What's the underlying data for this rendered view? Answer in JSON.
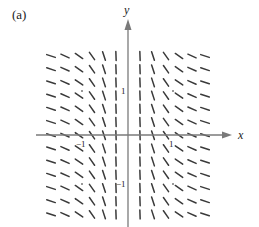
{
  "figure": {
    "panel_label": "(a)",
    "x_axis_label": "x",
    "y_axis_label": "y",
    "tick_labels": {
      "x_neg1": "−1",
      "x_pos1": "1",
      "y_pos1": "1",
      "y_neg1": "−1"
    },
    "colors": {
      "segment": "#3a3a3a",
      "axis": "#777777",
      "text": "#222222",
      "dot": "#777777"
    }
  },
  "chart_data": {
    "type": "slope-field",
    "title": "(a)",
    "xlabel": "x",
    "ylabel": "y",
    "x_ticks": [
      -1,
      1
    ],
    "y_ticks": [
      -1,
      1
    ],
    "grid_columns_x": [
      -1.69,
      -1.38,
      -1.07,
      -0.78,
      -0.51,
      -0.24,
      0.27,
      0.56,
      0.84,
      1.13,
      1.42,
      1.71
    ],
    "grid_rows_count": 13,
    "slope_depends_on": "x only (downward slopes, steep near x=0, shallow far from axis)",
    "marked_points": [
      [
        -1,
        1
      ],
      [
        1,
        1
      ],
      [
        -1,
        -1
      ],
      [
        1,
        -1
      ]
    ]
  }
}
